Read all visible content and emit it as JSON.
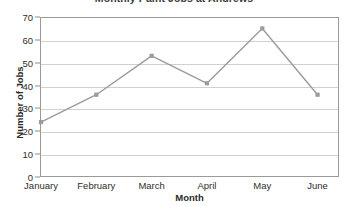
{
  "chart_data": {
    "type": "line",
    "title": "Monthly Paint Jobs at Andrews",
    "xlabel": "Month",
    "ylabel": "Number of Jobs",
    "categories": [
      "January",
      "February",
      "March",
      "April",
      "May",
      "June"
    ],
    "values": [
      24,
      36,
      53,
      41,
      65,
      36
    ],
    "ylim": [
      0,
      70
    ],
    "yticks": [
      0,
      10,
      20,
      30,
      40,
      50,
      60,
      70
    ],
    "grid": "horizontal",
    "legend": "none",
    "series_color": "#9b9b9b",
    "marker": "square",
    "gridline_color": "#d0d0d0",
    "frame_color": "#9a9a9a",
    "text_color": "#2e2e2e"
  }
}
